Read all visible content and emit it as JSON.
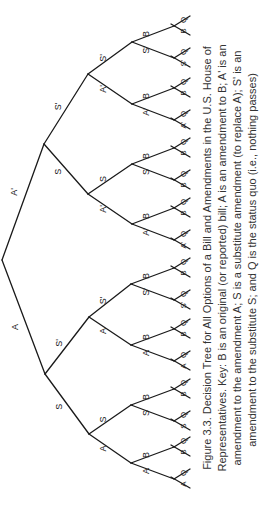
{
  "figure": {
    "number": "Figure 3.3.",
    "caption_lines": [
      "Figure 3.3.    Decision Tree for All Options of a Bill and Amendments in the U.S. House of",
      "Representatives. Key: B is an original (or reported) bill; A is an amendment to B; A' is an",
      "amendment to the amendment A; S is a substitute amendment (to replace A); S' is an",
      "amendment to the substitute S; and Q is the status quo (i.e., nothing passes)"
    ],
    "orientation": "rotated 90° counterclockwise"
  },
  "tree": {
    "root": {
      "children": [
        {
          "label": "A",
          "children": [
            {
              "label": "S",
              "children": [
                {
                  "label": "A",
                  "children": [
                    {
                      "label": "A",
                      "leaves": [
                        "A",
                        "Q"
                      ]
                    },
                    {
                      "label": "B",
                      "leaves": [
                        "B",
                        "Q"
                      ]
                    }
                  ]
                },
                {
                  "label": "S",
                  "children": [
                    {
                      "label": "S",
                      "leaves": [
                        "S",
                        "Q"
                      ]
                    },
                    {
                      "label": "B",
                      "leaves": [
                        "B",
                        "Q"
                      ]
                    }
                  ]
                }
              ]
            },
            {
              "label": "S'",
              "children": [
                {
                  "label": "A",
                  "children": [
                    {
                      "label": "A",
                      "leaves": [
                        "A",
                        "Q"
                      ]
                    },
                    {
                      "label": "B",
                      "leaves": [
                        "B",
                        "Q"
                      ]
                    }
                  ]
                },
                {
                  "label": "S'",
                  "children": [
                    {
                      "label": "S'",
                      "leaves": [
                        "S'",
                        "Q"
                      ]
                    },
                    {
                      "label": "B",
                      "leaves": [
                        "B",
                        "Q"
                      ]
                    }
                  ]
                }
              ]
            }
          ]
        },
        {
          "label": "A'",
          "children": [
            {
              "label": "S",
              "children": [
                {
                  "label": "A'",
                  "children": [
                    {
                      "label": "A'",
                      "leaves": [
                        "A'",
                        "Q"
                      ]
                    },
                    {
                      "label": "B",
                      "leaves": [
                        "B",
                        "Q"
                      ]
                    }
                  ]
                },
                {
                  "label": "S",
                  "children": [
                    {
                      "label": "S",
                      "leaves": [
                        "B",
                        "Q"
                      ]
                    },
                    {
                      "label": "B",
                      "leaves": [
                        "B",
                        "Q"
                      ]
                    }
                  ]
                }
              ]
            },
            {
              "label": "S'",
              "children": [
                {
                  "label": "A'",
                  "children": [
                    {
                      "label": "A'",
                      "leaves": [
                        "A'",
                        "Q"
                      ]
                    },
                    {
                      "label": "B",
                      "leaves": [
                        "B",
                        "Q"
                      ]
                    }
                  ]
                },
                {
                  "label": "S'",
                  "children": [
                    {
                      "label": "S'",
                      "leaves": [
                        "S'",
                        "Q"
                      ]
                    },
                    {
                      "label": "B",
                      "leaves": [
                        "B",
                        "Q"
                      ]
                    }
                  ]
                }
              ]
            }
          ]
        }
      ]
    }
  },
  "labels": {
    "l1": [
      "A",
      "A'"
    ],
    "l2": [
      "S",
      "S'",
      "S",
      "S'"
    ],
    "l3": [
      "A",
      "S",
      "A",
      "S'",
      "A'",
      "S",
      "A'",
      "S'"
    ],
    "l4": [
      "A",
      "B",
      "S",
      "B",
      "A",
      "B",
      "S'",
      "B",
      "A'",
      "B",
      "S",
      "B",
      "A'",
      "B",
      "S'",
      "B"
    ],
    "leaf_lower": [
      "A",
      "B",
      "S",
      "B",
      "A",
      "B",
      "S'",
      "B",
      "A'",
      "B",
      "B",
      "B",
      "A'",
      "B",
      "S'",
      "B"
    ],
    "leaf_upper": [
      "Q",
      "Q",
      "Q",
      "Q",
      "Q",
      "Q",
      "Q",
      "Q",
      "Q",
      "Q",
      "Q",
      "Q",
      "Q",
      "Q",
      "Q",
      "Q"
    ]
  }
}
